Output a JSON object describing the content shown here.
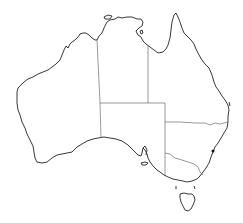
{
  "map": {
    "subject": "Australia outline map",
    "colors": {
      "background": "#ffffff",
      "coastline": "#222222",
      "borders": "#555555",
      "marker": "#111111"
    },
    "regions": [
      {
        "id": "wa",
        "label": ""
      },
      {
        "id": "nt",
        "label": ""
      },
      {
        "id": "sa",
        "label": ""
      },
      {
        "id": "qld",
        "label": ""
      },
      {
        "id": "nsw",
        "label": ""
      },
      {
        "id": "vic",
        "label": ""
      },
      {
        "id": "tas",
        "label": ""
      }
    ],
    "markers": [
      {
        "id": "city-dot",
        "x": 213,
        "y": 151
      }
    ]
  }
}
